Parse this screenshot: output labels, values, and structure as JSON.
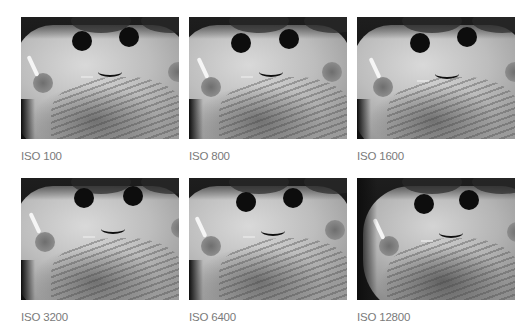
{
  "gallery": {
    "rows": [
      {
        "items": [
          {
            "label": "ISO 100",
            "image": "plush-toy-face-photo"
          },
          {
            "label": "ISO 800",
            "image": "plush-toy-face-photo"
          },
          {
            "label": "ISO 1600",
            "image": "plush-toy-face-photo"
          }
        ]
      },
      {
        "items": [
          {
            "label": "ISO 3200",
            "image": "plush-toy-face-photo"
          },
          {
            "label": "ISO 6400",
            "image": "plush-toy-face-photo"
          },
          {
            "label": "ISO 12800",
            "image": "plush-toy-face-photo"
          }
        ]
      }
    ]
  },
  "colors": {
    "background": "#ffffff",
    "caption": "#7a7a7a"
  }
}
